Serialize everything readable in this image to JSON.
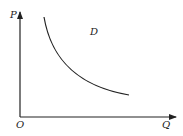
{
  "diagram": {
    "type": "demand-curve",
    "axes": {
      "y_label": "P",
      "x_label": "Q",
      "origin_label": "O"
    },
    "curve_label": "D",
    "colors": {
      "line": "#222222",
      "background": "#ffffff"
    }
  }
}
